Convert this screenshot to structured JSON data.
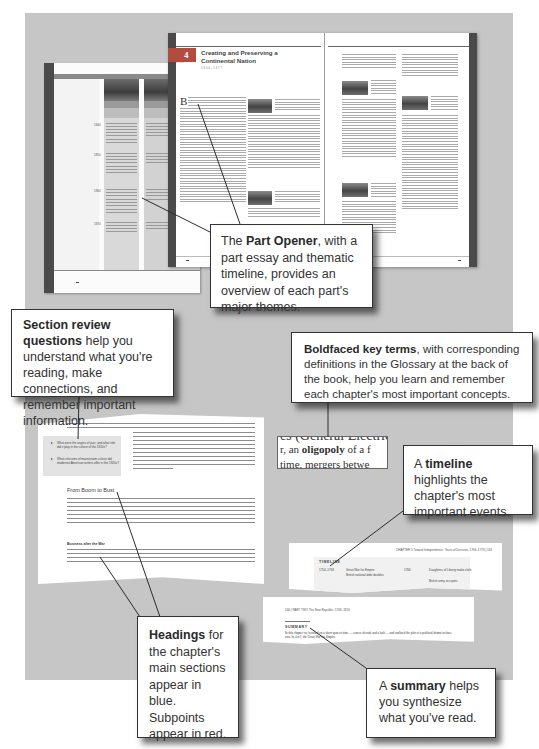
{
  "part_opener_spread": {
    "part_number": "4",
    "part_label": "PART",
    "title": "Creating and Preserving a Continental Nation",
    "dates": "1844–1877",
    "drop_cap": "B",
    "timeline_page": {
      "years": [
        "1844",
        "1850",
        "1860",
        "1870"
      ]
    }
  },
  "callouts": {
    "part_opener": {
      "lead": "The ",
      "bold": "Part Opener",
      "rest": ", with a part essay and thematic timeline, provides an overview of each part's major themes."
    },
    "section_review": {
      "bold": "Section review questions",
      "rest": " help you understand what you're reading, make connections, and remember important information."
    },
    "key_terms": {
      "bold": "Boldfaced key terms",
      "rest": ", with corresponding definitions in the Glossary at the back of the book, help you learn and remember each chapter's most important concepts."
    },
    "timeline": {
      "lead": "A ",
      "bold": "timeline",
      "rest": " highlights the chapter's most important events."
    },
    "headings": {
      "bold": "Headings",
      "rest": " for the chapter's main sections appear in blue. Subpoints appear in red."
    },
    "summary": {
      "lead": "A ",
      "bold": "summary",
      "rest": " helps you synthesize what you've read."
    }
  },
  "review_excerpt": {
    "questions": [
      "What were the origins of jazz, and what role did it play in the culture of the 1920s?",
      "What criticisms of mainstream culture did modernist American writers offer in the 1920s?"
    ],
    "main_heading": "From Boom to Bust",
    "sub_heading": "Business after the War"
  },
  "key_term_excerpt": {
    "line1": "es (General Electric)",
    "line2_pre": "r, an ",
    "line2_bold": "oligopoly",
    "line2_post": " of a f",
    "line3": "time, mergers betwe"
  },
  "timeline_excerpt": {
    "header": "CHAPTER 5  Toward Independence: Years of Decision, 1763–1776  |  163",
    "title": "TIMELINE",
    "rows": [
      {
        "date": "1754–1763",
        "event": "Great War for Empire",
        "date2": "1766",
        "event2": "Daughters of Liberty make cloth"
      },
      {
        "date": "",
        "event": "British national debt doubles",
        "date2": "",
        "event2": "British army occupies"
      }
    ]
  },
  "summary_excerpt": {
    "header": "166  |  PART TWO  The New Republic, 1763–1820",
    "title": "SUMMARY",
    "text": "In this chapter we focused on a short span of time — a mere decade and a half — and outlined the plot of a political drama in three acts. In Act I, the Great War for Empire"
  },
  "colors": {
    "background": "#c6c6c6",
    "page_edge": "#4a4a4a",
    "part_red": "#b34b3e",
    "callout_border": "#333333"
  }
}
